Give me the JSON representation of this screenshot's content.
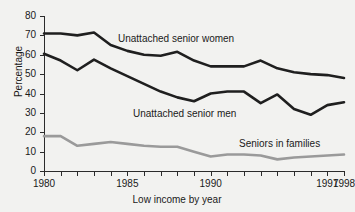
{
  "chart_data": {
    "type": "line",
    "title": "",
    "subtitle": "",
    "xlabel": "Low income by year",
    "ylabel": "Percentage",
    "x": [
      1980,
      1981,
      1982,
      1983,
      1984,
      1985,
      1986,
      1987,
      1988,
      1989,
      1990,
      1991,
      1992,
      1993,
      1994,
      1995,
      1996,
      1997,
      1998
    ],
    "xlim": [
      1980,
      1998
    ],
    "ylim": [
      0,
      80
    ],
    "xticks": [
      1980,
      1981,
      1982,
      1983,
      1984,
      1985,
      1986,
      1987,
      1988,
      1989,
      1990,
      1991,
      1992,
      1993,
      1994,
      1995,
      1996,
      1997,
      1998
    ],
    "xtick_labels": [
      "1980",
      "",
      "",
      "",
      "",
      "1985",
      "",
      "",
      "",
      "",
      "1990",
      "",
      "",
      "",
      "",
      "",
      "",
      "1997",
      "1998"
    ],
    "yticks": [
      0,
      10,
      20,
      30,
      40,
      50,
      60,
      70,
      80
    ],
    "ytick_labels": [
      "0",
      "10",
      "20",
      "30",
      "40",
      "50",
      "60",
      "70",
      "80"
    ],
    "grid": false,
    "legend_position": "inline-annotations",
    "series": [
      {
        "name": "Unattached senior women",
        "color": "#1f1f1f",
        "width": 2.6,
        "values": [
          71,
          71,
          70,
          71.5,
          65,
          62,
          60,
          59.5,
          61.5,
          57,
          54,
          54,
          54,
          57,
          53,
          51,
          50,
          49.5,
          48
        ]
      },
      {
        "name": "Unattached senior men",
        "color": "#1f1f1f",
        "width": 2.6,
        "values": [
          60.5,
          57,
          52,
          57.5,
          53,
          49,
          45,
          41,
          38,
          36,
          40,
          41,
          41,
          35,
          39.5,
          32,
          29,
          34,
          35.5
        ]
      },
      {
        "name": "Seniors in families",
        "color": "#9a9a9a",
        "width": 2.6,
        "values": [
          18,
          18,
          13,
          14,
          15,
          14,
          13,
          12.5,
          12.5,
          10,
          7.5,
          8.5,
          8.5,
          8,
          6,
          7,
          7.5,
          8,
          8.5
        ]
      }
    ],
    "annotations": [
      {
        "name": "Unattached senior women",
        "text": "Unattached senior women"
      },
      {
        "name": "Unattached senior men",
        "text": "Unattached senior men"
      },
      {
        "name": "Seniors in families",
        "text": "Seniors in families"
      }
    ],
    "colors": {
      "background": "#f2f2f0",
      "axis": "#2b2b2b",
      "text": "#1a1a1a",
      "dark_series": "#1f1f1f",
      "light_series": "#9a9a9a"
    }
  },
  "axes": {
    "y_title": "Percentage",
    "x_title": "Low income by year"
  },
  "labels": {
    "women": "Unattached senior women",
    "men": "Unattached senior men",
    "families": "Seniors in families"
  }
}
